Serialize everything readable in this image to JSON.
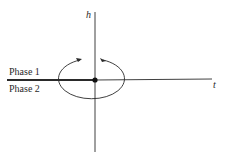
{
  "diagram": {
    "axes": {
      "vertical_label": "h",
      "horizontal_label": "t"
    },
    "regions": {
      "upper": "Phase 1",
      "lower": "Phase 2"
    },
    "elements": [
      "critical-point",
      "coexistence-line",
      "circular-path-with-arrows"
    ],
    "colors": {
      "line": "#2a2a2a",
      "background": "#ffffff"
    }
  }
}
